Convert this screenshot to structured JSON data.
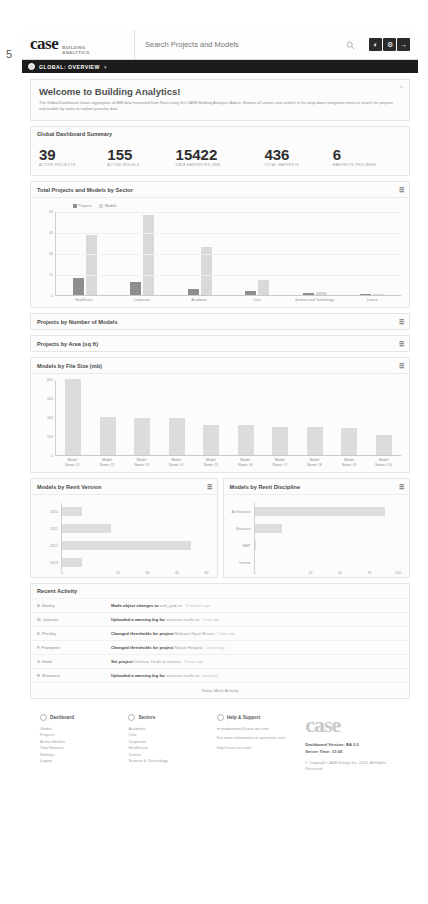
{
  "page_number": "5",
  "header": {
    "logo": "case",
    "logo_sub_1": "BUILDING",
    "logo_sub_2": "ANALYTICS",
    "search_placeholder": "Search Projects and Models",
    "search_value": "",
    "search_icon": "search-icon",
    "buttons": [
      {
        "name": "notifications-button",
        "glyph": "◐"
      },
      {
        "name": "settings-button",
        "glyph": "⚙"
      },
      {
        "name": "logout-button",
        "glyph": "→"
      }
    ]
  },
  "breadcrumb": {
    "label": "GLOBAL: OVERVIEW",
    "caret": "▾"
  },
  "welcome": {
    "title": "Welcome to Building Analytics!",
    "body": "The Global Dashboard shows aggregates of BIM data harvested from Revit using the CASE Building Analytics Add-in. Browse all sectors and unitech in the drop-down navigation menu or search for projects and models by name to explore granular data.",
    "close": "×"
  },
  "summary": {
    "title": "Global Dashboard Summary",
    "stats": [
      {
        "value": "39",
        "label": "ACTIVE PROJECTS"
      },
      {
        "value": "155",
        "label": "ACTIVE MODELS"
      },
      {
        "value": "15422",
        "label": "DATA HARVESTED (MB)"
      },
      {
        "value": "436",
        "label": "TOTAL HARVESTS"
      },
      {
        "value": "6",
        "label": "HARVESTS THIS WEEK"
      }
    ]
  },
  "collapsed_cards": [
    {
      "title": "Projects by Number of Models"
    },
    {
      "title": "Projects by Area (sq ft)"
    }
  ],
  "activity": {
    "title": "Recent Activity",
    "show_more": "Show More Activity",
    "rows": [
      {
        "who": "B. Marley",
        "action": "Made object changes to",
        "target": "wall_grid.rvt",
        "time": "12 minutes ago"
      },
      {
        "who": "M. Jackson",
        "action": "Uploaded a warning log for",
        "target": "structure-north.rvt",
        "time": "1 hour ago"
      },
      {
        "who": "E. Presley",
        "action": "Changed thresholds for project",
        "target": "Midtown Hyatt Resort",
        "time": "1 hour ago"
      },
      {
        "who": "P. Frampton",
        "action": "Changed thresholds for project",
        "target": "Nyack Hospital",
        "time": "2 hours ago"
      },
      {
        "who": "S. Hotel",
        "action": "Set project",
        "target": "Chelsea Yards to inactive",
        "time": "3 hours ago"
      },
      {
        "who": "R. Romance",
        "action": "Uploaded a warning log for",
        "target": "structure-north.rvt",
        "time": "yesterday"
      }
    ]
  },
  "footer": {
    "columns": [
      {
        "icon": "dashboard-icon",
        "title": "Dashboard",
        "links": [
          "Global",
          "Projects",
          "Active Models",
          "Total Harvest",
          "Settings",
          "Logout"
        ]
      },
      {
        "icon": "sectors-icon",
        "title": "Sectors",
        "links": [
          "Academic",
          "Civic",
          "Corporate",
          "Healthcare",
          "Justice",
          "Science & Technology"
        ]
      }
    ],
    "support": {
      "icon": "help-icon",
      "title": "Help & Support",
      "email": "m.mobasman@case-inc.com",
      "note": "For more information or questions visit:",
      "url": "http://case-inc.com/"
    },
    "brand": {
      "logo": "case",
      "version": "Dashboard Version: BA 2.0",
      "server_time": "Server Time: 13:05",
      "copyright": "© Copyright CASE Design Inc. 2013. All Rights Reserved."
    }
  },
  "chart_data": [
    {
      "type": "bar",
      "title": "Total Projects and Models by Sector",
      "categories": [
        "Healthcare",
        "Corporate",
        "Academic",
        "Civic",
        "Science and Technology",
        "Justice"
      ],
      "series": [
        {
          "name": "Projects",
          "color": "#8e8e8e",
          "values": [
            12,
            9,
            4,
            3,
            1.5,
            0.5
          ]
        },
        {
          "name": "Models",
          "color": "#d9d9d9",
          "values": [
            43,
            57,
            34,
            11,
            2.5,
            1
          ]
        }
      ],
      "yticks": [
        0,
        15,
        30,
        45,
        60
      ],
      "ylim": [
        0,
        60
      ],
      "xlabel": "",
      "ylabel": "",
      "grid": true,
      "legend": "top-left"
    },
    {
      "type": "bar",
      "title": "Models by File Size (mb)",
      "categories": [
        "Model Name #1",
        "Model Name #2",
        "Model Name #3",
        "Model Name #4",
        "Model Name #5",
        "Model Name #6",
        "Model Name #7",
        "Model Name #8",
        "Model Name #9",
        "Model Name #10"
      ],
      "values": [
        800,
        400,
        385,
        385,
        320,
        312,
        300,
        295,
        280,
        215
      ],
      "color": "#dcdcdc",
      "yticks": [
        0,
        200,
        400,
        600,
        800
      ],
      "ylim": [
        0,
        800
      ],
      "xlabel": "",
      "ylabel": "",
      "grid": false
    },
    {
      "type": "bar",
      "orientation": "horizontal",
      "title": "Models by Revit Version",
      "categories": [
        "2010",
        "2011",
        "2012",
        "2013"
      ],
      "values": [
        8,
        20,
        53,
        8
      ],
      "color": "#dddddd",
      "xticks": [
        0,
        15,
        30,
        45,
        60
      ],
      "xlim": [
        0,
        60
      ],
      "xlabel": "",
      "ylabel": "",
      "grid": false
    },
    {
      "type": "bar",
      "orientation": "horizontal",
      "title": "Models by Revit Discipline",
      "categories": [
        "Architecture",
        "Structure",
        "MEP",
        "Interior"
      ],
      "values": [
        89,
        19,
        1,
        0
      ],
      "color": "#dddddd",
      "xticks": [
        0,
        25,
        50,
        75,
        100
      ],
      "xlim": [
        0,
        100
      ],
      "xlabel": "",
      "ylabel": "",
      "grid": true
    }
  ]
}
